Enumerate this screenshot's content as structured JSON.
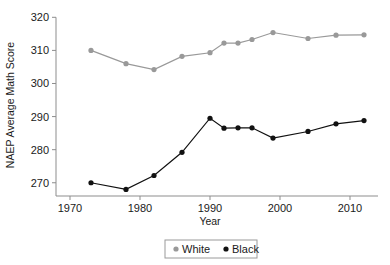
{
  "chart_data": {
    "type": "line",
    "title": "",
    "xlabel": "Year",
    "ylabel": "NAEP Average Math Score",
    "xlim": [
      1968,
      2014
    ],
    "ylim": [
      266,
      321
    ],
    "xticks": [
      1970,
      1980,
      1990,
      2000,
      2010
    ],
    "xtick_labels": [
      "1970",
      "1980",
      "1990",
      "2000",
      "2010"
    ],
    "yticks": [
      270,
      280,
      290,
      300,
      310,
      320
    ],
    "ytick_labels": [
      "270",
      "280",
      "290",
      "300",
      "310",
      "320"
    ],
    "grid": false,
    "legend_position": "bottom-center",
    "series": [
      {
        "name": "White",
        "color": "#999999",
        "marker": "circle",
        "x": [
          1973,
          1978,
          1982,
          1986,
          1990,
          1992,
          1994,
          1996,
          1999,
          2004,
          2008,
          2012
        ],
        "values": [
          310.0,
          306.0,
          304.2,
          308.2,
          309.3,
          312.2,
          312.2,
          313.3,
          315.4,
          313.6,
          314.6,
          314.7
        ]
      },
      {
        "name": "Black",
        "color": "#111111",
        "marker": "circle",
        "x": [
          1973,
          1978,
          1982,
          1986,
          1990,
          1992,
          1994,
          1996,
          1999,
          2004,
          2008,
          2012
        ],
        "values": [
          270.0,
          268.0,
          272.2,
          279.2,
          289.5,
          286.5,
          286.6,
          286.6,
          283.5,
          285.5,
          287.8,
          288.8
        ]
      }
    ]
  },
  "legend": {
    "entries": [
      {
        "label": "White",
        "color": "#999999"
      },
      {
        "label": "Black",
        "color": "#111111"
      }
    ]
  },
  "axes": {
    "x_title": "Year",
    "y_title": "NAEP Average Math Score"
  }
}
